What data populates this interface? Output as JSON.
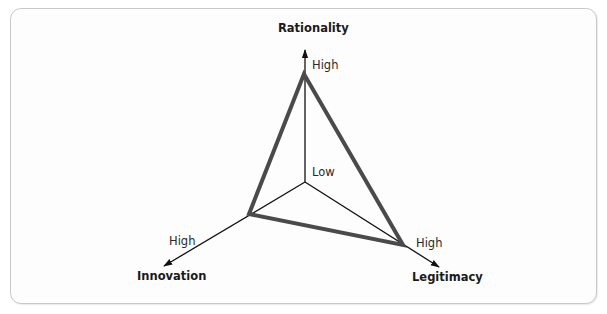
{
  "diagram": {
    "type": "radar-triangle",
    "axes": [
      {
        "name": "Rationality",
        "high_label": "High"
      },
      {
        "name": "Innovation",
        "high_label": "High"
      },
      {
        "name": "Legitimacy",
        "high_label": "High"
      }
    ],
    "center_label": "Low",
    "colors": {
      "axis": "#111111",
      "triangle": "#4a4a4a",
      "border": "#c9c9c9"
    }
  }
}
